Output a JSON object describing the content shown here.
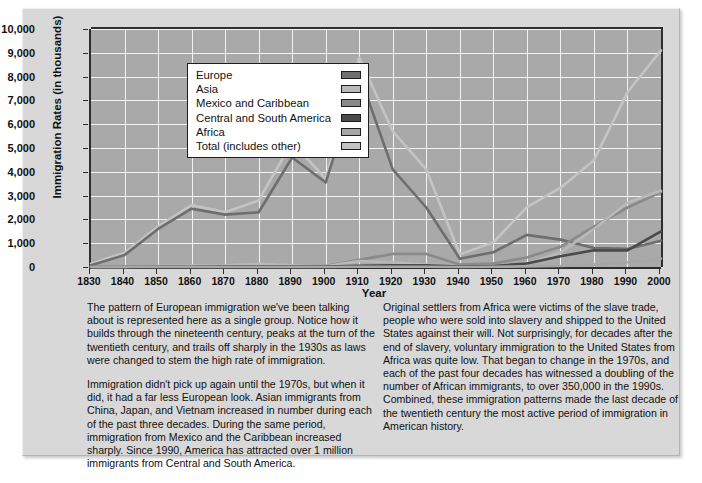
{
  "figure": {
    "ylabel": "Immigration Rates (in thousands)",
    "xlabel": "Year"
  },
  "legend": {
    "entries": [
      {
        "label": "Europe",
        "color": "#6e6e6e"
      },
      {
        "label": "Asia",
        "color": "#b9b9b9"
      },
      {
        "label": "Mexico and Caribbean",
        "color": "#8a8a8a"
      },
      {
        "label": "Central and South America",
        "color": "#4a4a4a"
      },
      {
        "label": "Africa",
        "color": "#a6a6a6"
      },
      {
        "label": "Total (includes other)",
        "color": "#c4c4c4"
      }
    ]
  },
  "captions": {
    "left": [
      "The pattern of European immigration we've been talking about is represented here as a single group. Notice how it builds through the nineteenth century, peaks at the turn of the twentieth century, and trails off sharply in the 1930s as laws were changed to stem the high rate of immigration.",
      "Immigration didn't pick up again until the 1970s, but when it did, it had a far less European look. Asian immigrants from China, Japan, and Vietnam increased in number during each of the past three decades. During the same period, immigration from Mexico and the Caribbean increased sharply. Since 1990, America has attracted over 1 million immigrants from Central and South America."
    ],
    "right": [
      "Original settlers from Africa were victims of the slave trade, people who were sold into slavery and shipped to the United States against their will. Not surprisingly, for decades after the end of slavery, voluntary immigration to the United States from Africa was quite low. That began to change in the 1970s, and each of the past four decades has witnessed a doubling of the number of African immigrants, to over 350,000 in the 1990s. Combined, these immigration patterns made the last decade of the twentieth century the most active period of immigration in American history."
    ]
  },
  "chart_data": {
    "type": "line",
    "title": "",
    "xlabel": "Year",
    "ylabel": "Immigration Rates (in thousands)",
    "xlim": [
      1830,
      2000
    ],
    "ylim": [
      0,
      10000
    ],
    "ytick_labels": [
      "10,000",
      "9,000",
      "8,000",
      "7,000",
      "6,000",
      "5,000",
      "4,000",
      "3,000",
      "2,000",
      "1,000",
      "0"
    ],
    "ytick_values": [
      10000,
      9000,
      8000,
      7000,
      6000,
      5000,
      4000,
      3000,
      2000,
      1000,
      0
    ],
    "x": [
      1830,
      1840,
      1850,
      1860,
      1870,
      1880,
      1890,
      1900,
      1910,
      1920,
      1930,
      1940,
      1950,
      1960,
      1970,
      1980,
      1990,
      2000
    ],
    "xtick_labels": [
      "1830",
      "1840",
      "1850",
      "1860",
      "1870",
      "1880",
      "1890",
      "1900",
      "1910",
      "1920",
      "1930",
      "1940",
      "1950",
      "1960",
      "1970",
      "1980",
      "1990",
      "2000"
    ],
    "grid": true,
    "legend_position": "upper-left-inside",
    "series": [
      {
        "name": "Europe",
        "color": "#6e6e6e",
        "values": [
          70,
          500,
          1600,
          2450,
          2200,
          2300,
          4600,
          3550,
          8100,
          4100,
          2500,
          350,
          620,
          1350,
          1150,
          800,
          760,
          1100
        ]
      },
      {
        "name": "Asia",
        "color": "#b9b9b9",
        "values": [
          0,
          0,
          40,
          60,
          70,
          130,
          70,
          30,
          250,
          200,
          100,
          20,
          40,
          150,
          600,
          1600,
          2700,
          3200
        ]
      },
      {
        "name": "Mexico and Caribbean",
        "color": "#8a8a8a",
        "values": [
          0,
          10,
          30,
          40,
          50,
          70,
          50,
          40,
          300,
          550,
          550,
          100,
          150,
          400,
          850,
          1700,
          2500,
          3150
        ]
      },
      {
        "name": "Central and South America",
        "color": "#4a4a4a",
        "values": [
          0,
          0,
          10,
          10,
          20,
          20,
          20,
          20,
          50,
          70,
          70,
          20,
          40,
          150,
          450,
          700,
          700,
          1500
        ]
      },
      {
        "name": "Africa",
        "color": "#a6a6a6",
        "values": [
          0,
          0,
          0,
          0,
          0,
          0,
          0,
          0,
          10,
          10,
          10,
          0,
          10,
          20,
          40,
          100,
          200,
          350
        ]
      },
      {
        "name": "Total (includes other)",
        "color": "#c4c4c4",
        "values": [
          140,
          600,
          1700,
          2600,
          2300,
          2800,
          5250,
          3700,
          8800,
          5700,
          4100,
          530,
          1035,
          2515,
          3320,
          4490,
          7340,
          9100
        ]
      }
    ]
  }
}
